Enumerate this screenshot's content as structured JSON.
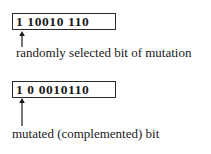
{
  "diagram": {
    "type": "bit-mutation-illustration",
    "before": {
      "bits": "1 10010 110",
      "caption": "randomly selected bit of mutation",
      "selected_bit_index": 1
    },
    "after": {
      "bits": "1 0 0010110",
      "caption": "mutated (complemented) bit",
      "mutated_bit_index": 1
    },
    "icons": {
      "pointer_arrow": "arrow-up-icon"
    },
    "colors": {
      "ink": "#1a1a1a",
      "background": "#ffffff"
    }
  }
}
